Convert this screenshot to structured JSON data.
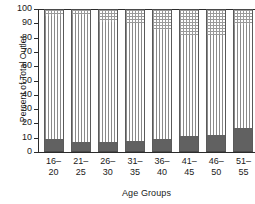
{
  "chart_data": {
    "type": "bar",
    "subtype": "stacked-bar",
    "title": "",
    "xlabel": "Age Groups",
    "ylabel": "Percent of Total Outlet",
    "categories": [
      "16-20",
      "21-25",
      "26-30",
      "31-35",
      "36-40",
      "41-45",
      "46-50",
      "51-55"
    ],
    "category_lines": [
      {
        "top": "16–",
        "bottom": "20"
      },
      {
        "top": "21–",
        "bottom": "25"
      },
      {
        "top": "26–",
        "bottom": "30"
      },
      {
        "top": "31–",
        "bottom": "35"
      },
      {
        "top": "36–",
        "bottom": "40"
      },
      {
        "top": "41–",
        "bottom": "45"
      },
      {
        "top": "46–",
        "bottom": "50"
      },
      {
        "top": "51–",
        "bottom": "55"
      }
    ],
    "ylim": [
      0,
      100
    ],
    "yticks": [
      0,
      10,
      20,
      30,
      40,
      50,
      60,
      70,
      80,
      90,
      100
    ],
    "ytick_labels": [
      "0",
      "10",
      "20",
      "30",
      "40",
      "50",
      "60",
      "70",
      "80",
      "90",
      "100"
    ],
    "grid": false,
    "legend": "none",
    "series": [
      {
        "name": "bottom-segment",
        "fill": "solid-dark",
        "color": "#616161",
        "values": [
          9,
          7,
          7,
          8,
          9,
          11,
          12,
          17
        ]
      },
      {
        "name": "middle-segment",
        "fill": "vertical-stripes",
        "color": "#8a8a8a",
        "values": [
          86,
          89,
          84,
          82,
          76,
          71,
          70,
          72
        ]
      },
      {
        "name": "top-segment",
        "fill": "cross-hatch",
        "color": "#9a9a9a",
        "values": [
          5,
          4,
          9,
          10,
          15,
          18,
          18,
          11
        ]
      }
    ]
  },
  "axis": {
    "y_title": "Percent of Total Outlet",
    "x_title": "Age Groups"
  },
  "colors": {
    "axis": "#2b2b2b",
    "dark_fill": "#616161",
    "medium_fill": "#8e8e8e",
    "stripe": "#8a8a8a",
    "hatch": "#9a9a9a",
    "background": "#ffffff"
  }
}
